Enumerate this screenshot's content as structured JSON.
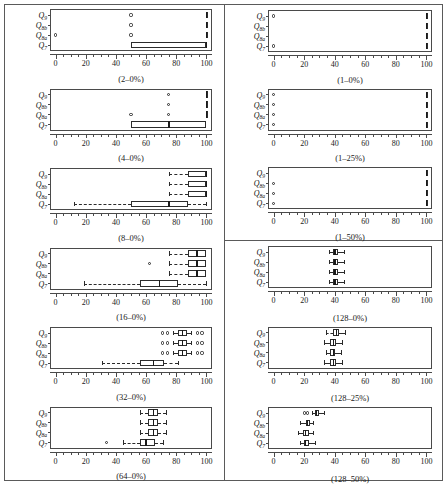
{
  "figure": {
    "title": "",
    "series_labels": [
      "Q9",
      "Q8b",
      "Q8a",
      "Q7"
    ],
    "series_labels_html": [
      "Q<sub>9</sub>",
      "Q<sub>8b</sub>",
      "Q<sub>8a</sub>",
      "Q<sub>7</sub>"
    ],
    "x_ticklabels": [
      "0",
      "20",
      "40",
      "60",
      "80",
      "100"
    ],
    "x_tickvalues": [
      0,
      20,
      40,
      60,
      80,
      100
    ],
    "xlim": [
      -3,
      103
    ],
    "left_column_captions": [
      "(2–0%)",
      "(4–0%)",
      "(8–0%)",
      "(16–0%)",
      "(32–0%)",
      "(64–0%)"
    ],
    "right_column_captions": [
      "(1–0%)",
      "(1–25%)",
      "(1–50%)",
      "(128–0%)",
      "(128–25%)",
      "(128–50%)"
    ]
  },
  "chart_data": {
    "type": "boxplot_grid",
    "title": "",
    "xlabel": "",
    "ylabel": "",
    "xlim": [
      0,
      100
    ],
    "xticks": [
      0,
      20,
      40,
      60,
      80,
      100
    ],
    "grid": false,
    "legend": "none",
    "categories": [
      "Q9",
      "Q8b",
      "Q8a",
      "Q7"
    ],
    "panels": [
      {
        "caption": "(2–0%)",
        "column": "left",
        "index": 0,
        "boxes": [
          {
            "category": "Q9",
            "whislo": 100,
            "q1": 100,
            "med": 100,
            "q3": 100,
            "whishi": 100,
            "outliers": [
              50
            ]
          },
          {
            "category": "Q8b",
            "whislo": 100,
            "q1": 100,
            "med": 100,
            "q3": 100,
            "whishi": 100,
            "outliers": [
              50
            ]
          },
          {
            "category": "Q8a",
            "whislo": 100,
            "q1": 100,
            "med": 100,
            "q3": 100,
            "whishi": 100,
            "outliers": [
              0,
              50
            ]
          },
          {
            "category": "Q7",
            "whislo": 50,
            "q1": 50,
            "med": 100,
            "q3": 100,
            "whishi": 100,
            "outliers": []
          }
        ]
      },
      {
        "caption": "(4–0%)",
        "column": "left",
        "index": 1,
        "boxes": [
          {
            "category": "Q9",
            "whislo": 100,
            "q1": 100,
            "med": 100,
            "q3": 100,
            "whishi": 100,
            "outliers": [
              75
            ]
          },
          {
            "category": "Q8b",
            "whislo": 100,
            "q1": 100,
            "med": 100,
            "q3": 100,
            "whishi": 100,
            "outliers": [
              75
            ]
          },
          {
            "category": "Q8a",
            "whislo": 100,
            "q1": 100,
            "med": 100,
            "q3": 100,
            "whishi": 100,
            "outliers": [
              50,
              75
            ]
          },
          {
            "category": "Q7",
            "whislo": 50,
            "q1": 50,
            "med": 75,
            "q3": 100,
            "whishi": 100,
            "outliers": []
          }
        ]
      },
      {
        "caption": "(8–0%)",
        "column": "left",
        "index": 2,
        "boxes": [
          {
            "category": "Q9",
            "whislo": 75,
            "q1": 87.5,
            "med": 100,
            "q3": 100,
            "whishi": 100,
            "outliers": []
          },
          {
            "category": "Q8b",
            "whislo": 75,
            "q1": 87.5,
            "med": 100,
            "q3": 100,
            "whishi": 100,
            "outliers": []
          },
          {
            "category": "Q8a",
            "whislo": 75,
            "q1": 87.5,
            "med": 100,
            "q3": 100,
            "whishi": 100,
            "outliers": []
          },
          {
            "category": "Q7",
            "whislo": 12.5,
            "q1": 50,
            "med": 75,
            "q3": 87.5,
            "whishi": 100,
            "outliers": []
          }
        ]
      },
      {
        "caption": "(16–0%)",
        "column": "left",
        "index": 3,
        "boxes": [
          {
            "category": "Q9",
            "whislo": 75,
            "q1": 87.5,
            "med": 93.75,
            "q3": 100,
            "whishi": 100,
            "outliers": []
          },
          {
            "category": "Q8b",
            "whislo": 75,
            "q1": 87.5,
            "med": 93.75,
            "q3": 100,
            "whishi": 100,
            "outliers": [
              62.5
            ]
          },
          {
            "category": "Q8a",
            "whislo": 75,
            "q1": 87.5,
            "med": 93.75,
            "q3": 100,
            "whishi": 100,
            "outliers": []
          },
          {
            "category": "Q7",
            "whislo": 18.75,
            "q1": 56.25,
            "med": 68.75,
            "q3": 81.25,
            "whishi": 100,
            "outliers": []
          }
        ]
      },
      {
        "caption": "(32–0%)",
        "column": "left",
        "index": 4,
        "boxes": [
          {
            "category": "Q9",
            "whislo": 78,
            "q1": 81,
            "med": 84,
            "q3": 87,
            "whishi": 90,
            "outliers": [
              71,
              74,
              94,
              97
            ]
          },
          {
            "category": "Q8b",
            "whislo": 78,
            "q1": 81,
            "med": 84,
            "q3": 87,
            "whishi": 90,
            "outliers": [
              71,
              74,
              94,
              97
            ]
          },
          {
            "category": "Q8a",
            "whislo": 78,
            "q1": 81,
            "med": 84,
            "q3": 87,
            "whishi": 90,
            "outliers": [
              71,
              74,
              94,
              97
            ]
          },
          {
            "category": "Q7",
            "whislo": 31,
            "q1": 56,
            "med": 65,
            "q3": 72,
            "whishi": 81,
            "outliers": []
          }
        ]
      },
      {
        "caption": "(64–0%)",
        "column": "left",
        "index": 5,
        "boxes": [
          {
            "category": "Q9",
            "whislo": 56,
            "q1": 61,
            "med": 65,
            "q3": 68,
            "whishi": 73,
            "outliers": []
          },
          {
            "category": "Q8b",
            "whislo": 56,
            "q1": 61,
            "med": 65,
            "q3": 68,
            "whishi": 73,
            "outliers": []
          },
          {
            "category": "Q8a",
            "whislo": 56,
            "q1": 61,
            "med": 65,
            "q3": 68,
            "whishi": 73,
            "outliers": []
          },
          {
            "category": "Q7",
            "whislo": 45,
            "q1": 56,
            "med": 60,
            "q3": 66,
            "whishi": 71,
            "outliers": [
              34
            ]
          }
        ]
      },
      {
        "caption": "(1–0%)",
        "column": "right",
        "index": 0,
        "boxes": [
          {
            "category": "Q9",
            "whislo": 100,
            "q1": 100,
            "med": 100,
            "q3": 100,
            "whishi": 100,
            "outliers": [
              0
            ]
          },
          {
            "category": "Q8b",
            "whislo": 100,
            "q1": 100,
            "med": 100,
            "q3": 100,
            "whishi": 100,
            "outliers": []
          },
          {
            "category": "Q8a",
            "whislo": 100,
            "q1": 100,
            "med": 100,
            "q3": 100,
            "whishi": 100,
            "outliers": []
          },
          {
            "category": "Q7",
            "whislo": 100,
            "q1": 100,
            "med": 100,
            "q3": 100,
            "whishi": 100,
            "outliers": [
              0
            ]
          }
        ]
      },
      {
        "caption": "(1–25%)",
        "column": "right",
        "index": 1,
        "boxes": [
          {
            "category": "Q9",
            "whislo": 100,
            "q1": 100,
            "med": 100,
            "q3": 100,
            "whishi": 100,
            "outliers": [
              0
            ]
          },
          {
            "category": "Q8b",
            "whislo": 100,
            "q1": 100,
            "med": 100,
            "q3": 100,
            "whishi": 100,
            "outliers": [
              0
            ]
          },
          {
            "category": "Q8a",
            "whislo": 100,
            "q1": 100,
            "med": 100,
            "q3": 100,
            "whishi": 100,
            "outliers": [
              0
            ]
          },
          {
            "category": "Q7",
            "whislo": 100,
            "q1": 100,
            "med": 100,
            "q3": 100,
            "whishi": 100,
            "outliers": [
              0
            ]
          }
        ]
      },
      {
        "caption": "(1–50%)",
        "column": "right",
        "index": 2,
        "boxes": [
          {
            "category": "Q9",
            "whislo": 100,
            "q1": 100,
            "med": 100,
            "q3": 100,
            "whishi": 100,
            "outliers": []
          },
          {
            "category": "Q8b",
            "whislo": 100,
            "q1": 100,
            "med": 100,
            "q3": 100,
            "whishi": 100,
            "outliers": [
              0
            ]
          },
          {
            "category": "Q8a",
            "whislo": 100,
            "q1": 100,
            "med": 100,
            "q3": 100,
            "whishi": 100,
            "outliers": [
              0
            ]
          },
          {
            "category": "Q7",
            "whislo": 100,
            "q1": 100,
            "med": 100,
            "q3": 100,
            "whishi": 100,
            "outliers": [
              0
            ]
          }
        ]
      },
      {
        "caption": "(128–0%)",
        "column": "right",
        "index": 3,
        "boxes": [
          {
            "category": "Q9",
            "whislo": 36,
            "q1": 39,
            "med": 40,
            "q3": 42,
            "whishi": 46,
            "outliers": []
          },
          {
            "category": "Q8b",
            "whislo": 36,
            "q1": 39,
            "med": 40,
            "q3": 42,
            "whishi": 46,
            "outliers": []
          },
          {
            "category": "Q8a",
            "whislo": 36,
            "q1": 39,
            "med": 40,
            "q3": 42,
            "whishi": 46,
            "outliers": []
          },
          {
            "category": "Q7",
            "whislo": 36,
            "q1": 39,
            "med": 40,
            "q3": 42,
            "whishi": 46,
            "outliers": []
          }
        ]
      },
      {
        "caption": "(128–25%)",
        "column": "right",
        "index": 4,
        "boxes": [
          {
            "category": "Q9",
            "whislo": 34,
            "q1": 39,
            "med": 41,
            "q3": 43,
            "whishi": 47,
            "outliers": []
          },
          {
            "category": "Q8b",
            "whislo": 33,
            "q1": 37,
            "med": 39,
            "q3": 41,
            "whishi": 45,
            "outliers": []
          },
          {
            "category": "Q8a",
            "whislo": 34,
            "q1": 37,
            "med": 39,
            "q3": 40,
            "whishi": 44,
            "outliers": []
          },
          {
            "category": "Q7",
            "whislo": 33,
            "q1": 37,
            "med": 39,
            "q3": 41,
            "whishi": 45,
            "outliers": []
          }
        ]
      },
      {
        "caption": "(128–50%)",
        "column": "right",
        "index": 5,
        "boxes": [
          {
            "category": "Q9",
            "whislo": 25,
            "q1": 27,
            "med": 28,
            "q3": 30,
            "whishi": 33,
            "outliers": [
              20,
              22
            ]
          },
          {
            "category": "Q8b",
            "whislo": 17,
            "q1": 21,
            "med": 22,
            "q3": 24,
            "whishi": 26,
            "outliers": []
          },
          {
            "category": "Q8a",
            "whislo": 16,
            "q1": 19,
            "med": 21,
            "q3": 23,
            "whishi": 26,
            "outliers": []
          },
          {
            "category": "Q7",
            "whislo": 17,
            "q1": 20,
            "med": 21,
            "q3": 23,
            "whishi": 27,
            "outliers": []
          }
        ]
      }
    ]
  }
}
